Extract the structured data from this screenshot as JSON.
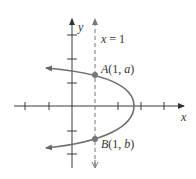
{
  "diagram": {
    "type": "parabola-graph",
    "axes": {
      "x_label": "x",
      "y_label": "y"
    },
    "vertical_line": {
      "label": "x = 1",
      "style": "dashed"
    },
    "points": [
      {
        "name": "A",
        "label_prefix": "A",
        "label_args": "(1, a)",
        "coords": "(1, a)"
      },
      {
        "name": "B",
        "label_prefix": "B",
        "label_args": "(1, b)",
        "coords": "(1, b)"
      }
    ],
    "curve": {
      "description": "parabola opening to the left with vertex on the positive x-axis",
      "color": "#6e6e6e"
    },
    "colors": {
      "axis": "#3a3a3a",
      "curve": "#6e6e6e",
      "point": "#777777"
    }
  }
}
